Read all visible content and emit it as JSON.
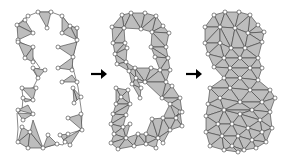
{
  "figure": {
    "colors": {
      "triangle_fill": "#bdbdbd",
      "edge": "#3a3a3a",
      "node_fill": "#ffffff",
      "arrow": "#000000"
    },
    "panels": [
      {
        "id": "stage-1",
        "label": "boundary-triangles"
      },
      {
        "id": "stage-2",
        "label": "boundary-layer-mesh"
      },
      {
        "id": "stage-3",
        "label": "full-mesh"
      }
    ],
    "arrows": [
      {
        "from": "stage-1",
        "to": "stage-2",
        "icon": "right-arrow-icon"
      },
      {
        "from": "stage-2",
        "to": "stage-3",
        "icon": "right-arrow-icon"
      }
    ]
  }
}
